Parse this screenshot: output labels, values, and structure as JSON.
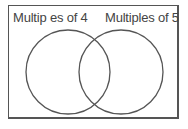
{
  "diagram": {
    "type": "venn",
    "sets": [
      {
        "label": "Multip es of 4",
        "cx": 68,
        "cy": 72,
        "r": 42
      },
      {
        "label": "Multiples of 5",
        "cx": 121,
        "cy": 72,
        "r": 42
      }
    ],
    "colors": {
      "stroke": "#555555",
      "text": "#444444",
      "background": "#ffffff"
    }
  }
}
